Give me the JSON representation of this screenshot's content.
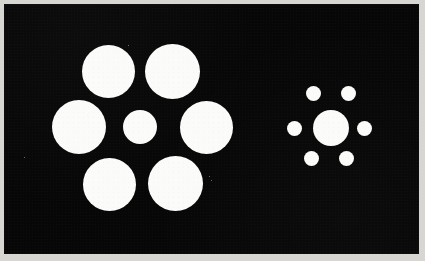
{
  "figure": {
    "background_color": "#070707",
    "disc_color": "#fbfbf9",
    "frame_color": "#d8d6d2",
    "panel": {
      "x": 4,
      "y": 4,
      "width": 415,
      "height": 250
    }
  },
  "chart_data": {
    "type": "scatter",
    "xlabel": "",
    "ylabel": "",
    "xlim": [
      0,
      425
    ],
    "ylim": [
      0,
      261
    ],
    "grid": false,
    "legend": "none",
    "annotations": [
      "Left target circle (diameter 34 px) surrounded by six large inducer circles",
      "Right target circle (diameter 36 px) surrounded by six small inducer circles",
      "Both target circles are nearly equal in physical size"
    ],
    "series": [
      {
        "name": "left-cluster-inducers-large",
        "shape": "circle",
        "fill": "#fbfbf9",
        "points": [
          {
            "label": "top-left",
            "cx": 108,
            "cy": 71,
            "d": 53
          },
          {
            "label": "top-right",
            "cx": 172,
            "cy": 71,
            "d": 55
          },
          {
            "label": "mid-left",
            "cx": 79,
            "cy": 127,
            "d": 54
          },
          {
            "label": "mid-right",
            "cx": 206,
            "cy": 127,
            "d": 53
          },
          {
            "label": "bottom-left",
            "cx": 109,
            "cy": 184,
            "d": 53
          },
          {
            "label": "bottom-right",
            "cx": 175,
            "cy": 183,
            "d": 55
          }
        ]
      },
      {
        "name": "left-cluster-target",
        "shape": "circle",
        "fill": "#fbfbf9",
        "points": [
          {
            "label": "center-target-left",
            "cx": 140,
            "cy": 127,
            "d": 34
          }
        ]
      },
      {
        "name": "right-cluster-inducers-small",
        "shape": "circle",
        "fill": "#fbfbf9",
        "points": [
          {
            "label": "top-left",
            "cx": 313,
            "cy": 93,
            "d": 15
          },
          {
            "label": "top-right",
            "cx": 348,
            "cy": 93,
            "d": 15
          },
          {
            "label": "mid-left",
            "cx": 294,
            "cy": 128,
            "d": 15
          },
          {
            "label": "mid-right",
            "cx": 364,
            "cy": 128,
            "d": 15
          },
          {
            "label": "bottom-left",
            "cx": 311,
            "cy": 158,
            "d": 15
          },
          {
            "label": "bottom-right",
            "cx": 346,
            "cy": 158,
            "d": 15
          }
        ]
      },
      {
        "name": "right-cluster-target",
        "shape": "circle",
        "fill": "#fbfbf9",
        "points": [
          {
            "label": "center-target-right",
            "cx": 331,
            "cy": 128,
            "d": 36
          }
        ]
      }
    ],
    "specks": [
      {
        "x": 128,
        "y": 45
      },
      {
        "x": 87,
        "y": 115
      },
      {
        "x": 24,
        "y": 157
      },
      {
        "x": 211,
        "y": 180
      },
      {
        "x": 209,
        "y": 176
      }
    ]
  }
}
